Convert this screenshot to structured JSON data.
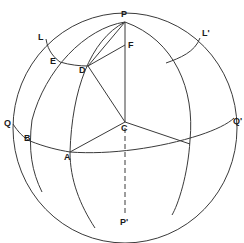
{
  "diagram": {
    "labels": {
      "P": "P",
      "P_prime": "P'",
      "F": "F",
      "C": "C",
      "D": "D",
      "E": "E",
      "L": "L",
      "L_prime": "L'",
      "Q": "Q",
      "Q_prime": "Q'",
      "A": "A",
      "B": "B"
    },
    "colors": {
      "line": "#3a3a3a",
      "text": "#1a1a1a",
      "background": "#ffffff"
    }
  }
}
